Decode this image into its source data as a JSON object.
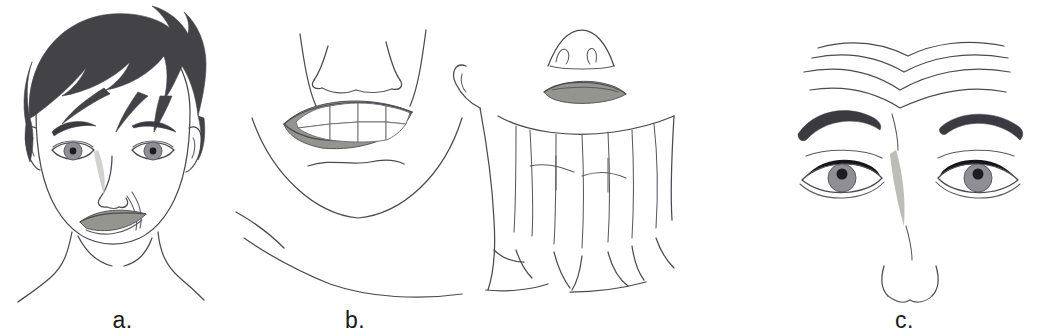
{
  "figure": {
    "background_color": "#ffffff",
    "width": 1041,
    "height": 336,
    "style": "black-and-white medical line drawing with gray shading",
    "panel_count": 3
  },
  "panels": [
    {
      "id": "a",
      "label": "a.",
      "subject": "full frontal face of a patient with short dark hair",
      "finding": "unilateral lower facial droop with flattened nasolabial fold and asymmetric mouth",
      "features": [
        "short dark layered hair with fringe",
        "two eyes with gray irises and dark pupils",
        "dark arched eyebrows",
        "nose with nostril outlines",
        "asymmetric drooping mouth, gray lips",
        "deepened crease from nose to chin on one side",
        "visible ear, jawline, neck and shoulder outlines"
      ],
      "colors": {
        "hair": "#434247",
        "eyebrow": "#3a3a40",
        "iris": "#8e8e94",
        "pupil": "#1d1d21",
        "lips": "#95958f",
        "outline": "#4a4a52"
      }
    },
    {
      "id": "b",
      "label": "b.",
      "subject": "lower face grimacing with teeth exposed, plus upturned head showing tensed neck",
      "finding": "platysma muscle bands prominent on neck during grimace",
      "features": [
        "nose with nostrils seen from front",
        "wide grimace showing upper and lower rows of teeth",
        "gray lips framing exposed teeth",
        "chin crease below mouth",
        "rounded jaw and chin outline",
        "head tilted back showing nose from below",
        "gray closed lips on upturned face",
        "ear outline on extended neck",
        "vertical platysma bands down the anterior neck",
        "clavicle and shoulder contour lines"
      ],
      "colors": {
        "lips": "#95958f",
        "teeth": "#ffffff",
        "outline": "#4a4a52"
      }
    },
    {
      "id": "c",
      "label": "c.",
      "subject": "forehead and eye region with brows elevated",
      "finding": "horizontal forehead rhytides and a vertical glabellar frown line",
      "features": [
        "four horizontal forehead wrinkle lines with a central V dip",
        "two dark arched eyebrows",
        "two eyes with gray irises, dark pupils and dark upper eyelid lines",
        "vertical gray glabellar crease between the brows",
        "nose tip outline with nostril curves at the bottom"
      ],
      "forehead_wrinkle_count": 4,
      "colors": {
        "eyebrow": "#3a3a40",
        "iris": "#8e8e94",
        "pupil": "#1d1d21",
        "glabellar_line": "#bdbdb8",
        "outline": "#4a4a52"
      }
    }
  ]
}
